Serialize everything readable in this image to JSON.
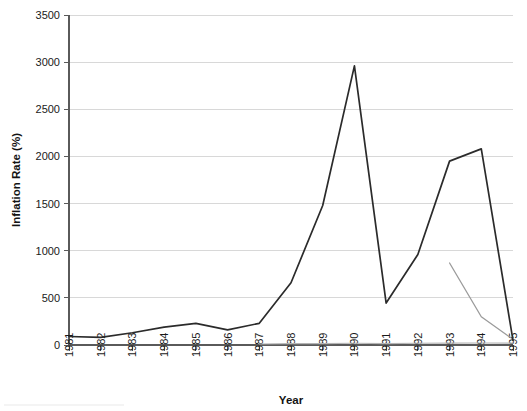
{
  "chart_data": {
    "type": "line",
    "title": "",
    "xlabel": "Year",
    "ylabel": "Inflation Rate (%)",
    "x": [
      1981,
      1982,
      1983,
      1984,
      1985,
      1986,
      1987,
      1988,
      1989,
      1990,
      1991,
      1992,
      1993,
      1994,
      1995
    ],
    "xtick_labels": [
      "1981",
      "1982",
      "1983",
      "1984",
      "1985",
      "1986",
      "1987",
      "1988",
      "1989",
      "1990",
      "1991",
      "1992",
      "1993",
      "1994",
      "1995"
    ],
    "ytick_labels": [
      "0",
      "500",
      "1000",
      "1500",
      "2000",
      "2500",
      "3000",
      "3500"
    ],
    "yticks": [
      0,
      500,
      1000,
      1500,
      2000,
      2500,
      3000,
      3500
    ],
    "xlim": [
      1981,
      1995
    ],
    "ylim": [
      0,
      3500
    ],
    "grid": "horizontal",
    "legend": "none",
    "series": [
      {
        "name": "main-inflation-series",
        "color": "#2b2b2b",
        "x": [
          1981,
          1982,
          1983,
          1984,
          1985,
          1986,
          1987,
          1988,
          1989,
          1990,
          1991,
          1992,
          1993,
          1994,
          1995
        ],
        "values": [
          90,
          80,
          130,
          190,
          230,
          160,
          230,
          660,
          1480,
          2960,
          445,
          960,
          1950,
          2080,
          50
        ]
      },
      {
        "name": "secondary-series",
        "color": "#9b9b9b",
        "x": [
          1993,
          1994,
          1995
        ],
        "values": [
          870,
          300,
          60
        ]
      },
      {
        "name": "baseline-series",
        "color": "#b4b4b4",
        "x": [
          1987,
          1988,
          1989,
          1990,
          1991,
          1992,
          1993,
          1994,
          1995
        ],
        "values": [
          10,
          15,
          15,
          18,
          15,
          18,
          20,
          22,
          20
        ]
      }
    ]
  },
  "axes": {
    "y_title": "Inflation Rate (%)",
    "x_title": "Year"
  }
}
